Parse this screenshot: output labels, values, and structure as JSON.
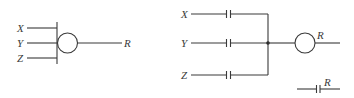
{
  "diagrams": {
    "left": {
      "title": "Gate symbol (OR relay equivalent)",
      "inputs": [
        {
          "label": "X",
          "y": 28
        },
        {
          "label": "Y",
          "y": 43
        },
        {
          "label": "Z",
          "y": 58
        }
      ],
      "output": {
        "label": "R"
      }
    },
    "right": {
      "title": "Ladder logic equivalent",
      "rungs": [
        {
          "label": "X",
          "y": 14
        },
        {
          "label": "Y",
          "y": 43
        },
        {
          "label": "Z",
          "y": 75
        }
      ],
      "coil": {
        "label": "R"
      },
      "contact": {
        "label": "R"
      }
    }
  },
  "colors": {
    "stroke": "#3a3a3a",
    "background": "#ffffff"
  }
}
